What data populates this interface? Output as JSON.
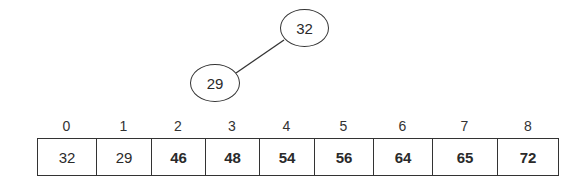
{
  "tree": {
    "nodes": [
      {
        "id": "root",
        "value": "32"
      },
      {
        "id": "left-child",
        "value": "29"
      }
    ],
    "edges": [
      [
        "root",
        "left-child"
      ]
    ]
  },
  "array": {
    "indices": [
      "0",
      "1",
      "2",
      "3",
      "4",
      "5",
      "6",
      "7",
      "8"
    ],
    "cells": [
      {
        "value": "32",
        "bold": false
      },
      {
        "value": "29",
        "bold": false
      },
      {
        "value": "46",
        "bold": true
      },
      {
        "value": "48",
        "bold": true
      },
      {
        "value": "54",
        "bold": true
      },
      {
        "value": "56",
        "bold": true
      },
      {
        "value": "64",
        "bold": true
      },
      {
        "value": "65",
        "bold": true
      },
      {
        "value": "72",
        "bold": true
      }
    ]
  }
}
